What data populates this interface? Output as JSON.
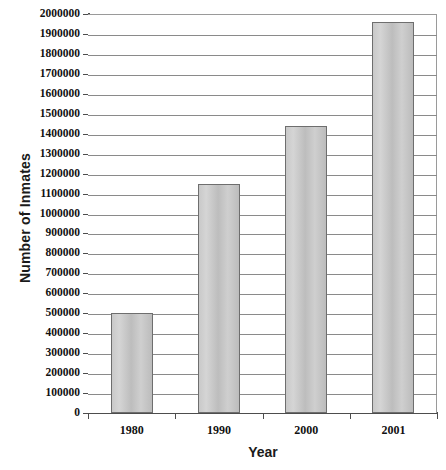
{
  "chart_data": {
    "type": "bar",
    "title": "",
    "subtitle": "",
    "xlabel": "Year",
    "ylabel": "Number of Inmates",
    "categories": [
      "1980",
      "1990",
      "2000",
      "2001"
    ],
    "values": [
      500000,
      1150000,
      1440000,
      1960000
    ],
    "series": [
      {
        "name": "Number of Inmates",
        "values": [
          500000,
          1150000,
          1440000,
          1960000
        ]
      }
    ],
    "ylim": [
      0,
      2000000
    ],
    "ytick_step": 100000,
    "yticks": [
      "2000000",
      "1900000",
      "1800000",
      "1700000",
      "1600000",
      "1500000",
      "1400000",
      "1300000",
      "1200000",
      "1100000",
      "1000000",
      "900000",
      "800000",
      "700000",
      "600000",
      "500000",
      "400000",
      "300000",
      "200000",
      "100000",
      "0"
    ],
    "grid": "horizontal",
    "legend": "none",
    "bar_fill_color": "#c6c6c6",
    "bar_border_color": "#6e6e6e",
    "gridline_color": "#8a8a8a",
    "axis_color": "#4d4d4d",
    "background_color": "#ffffff",
    "annotations": []
  }
}
